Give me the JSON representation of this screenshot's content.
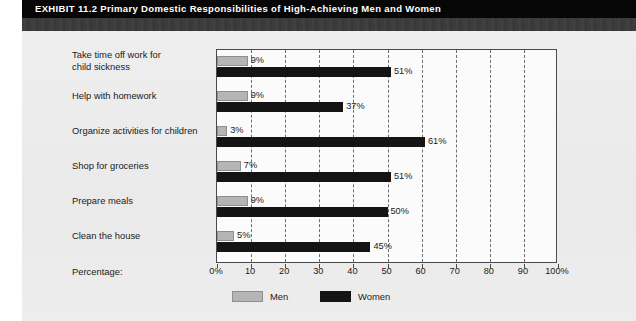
{
  "header": {
    "exhibit_label": "EXHIBIT 11.2",
    "title": "Primary Domestic Responsibilities of High-Achieving Men and Women",
    "full_title": "EXHIBIT 11.2  Primary Domestic Responsibilities of High-Achieving Men and Women"
  },
  "axis": {
    "percentage_caption": "Percentage:"
  },
  "legend": {
    "men": "Men",
    "women": "Women"
  },
  "colors": {
    "men_bar": "#b5b5b5",
    "women_bar": "#141414",
    "header_bar": "#060606",
    "sub_band": "#3b3b3b",
    "panel": "#ececec",
    "plot_background": "#fbfbfb",
    "gridline": "#6e6e6e"
  },
  "chart_data": {
    "type": "bar",
    "orientation": "horizontal",
    "title": "Primary Domestic Responsibilities of High-Achieving Men and Women",
    "xlabel": "Percentage:",
    "ylabel": "",
    "xlim": [
      0,
      100
    ],
    "grid": true,
    "legend_position": "bottom",
    "categories": [
      "Take time off work for child sickness",
      "Help with homework",
      "Organize activities for children",
      "Shop for groceries",
      "Prepare meals",
      "Clean the house"
    ],
    "category_lines": [
      [
        "Take time off work for",
        "child sickness"
      ],
      [
        "Help with homework"
      ],
      [
        "Organize activities for children"
      ],
      [
        "Shop for groceries"
      ],
      [
        "Prepare meals"
      ],
      [
        "Clean the house"
      ]
    ],
    "series": [
      {
        "name": "Men",
        "values": [
          9,
          9,
          3,
          7,
          9,
          5
        ],
        "labels": [
          "9%",
          "9%",
          "3%",
          "7%",
          "9%",
          "5%"
        ]
      },
      {
        "name": "Women",
        "values": [
          51,
          37,
          61,
          51,
          50,
          45
        ],
        "labels": [
          "51%",
          "37%",
          "61%",
          "51%",
          "50%",
          "45%"
        ]
      }
    ],
    "x_ticks": [
      0,
      10,
      20,
      30,
      40,
      50,
      60,
      70,
      80,
      90,
      100
    ],
    "x_tick_labels": [
      "0%",
      "10",
      "20",
      "30",
      "40",
      "50",
      "60",
      "70",
      "80",
      "90",
      "100%"
    ]
  }
}
